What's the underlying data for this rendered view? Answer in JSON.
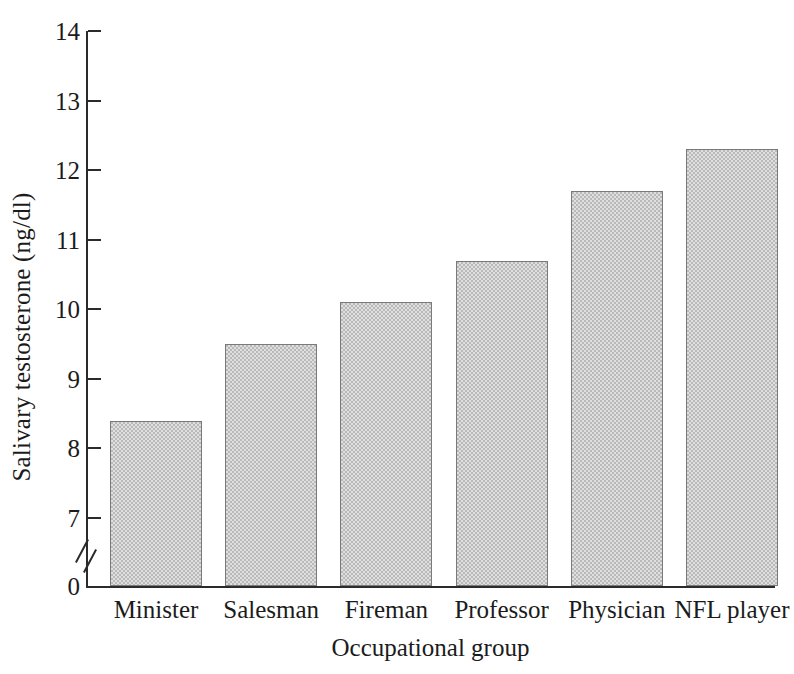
{
  "chart_data": {
    "type": "bar",
    "title": "",
    "subtitle": "",
    "xlabel": "Occupational group",
    "ylabel": "Salivary testosterone (ng/dl)",
    "categories": [
      "Minister",
      "Salesman",
      "Fireman",
      "Professor",
      "Physician",
      "NFL player"
    ],
    "values": [
      8.4,
      9.5,
      10.1,
      10.7,
      11.7,
      12.3
    ],
    "series": [
      {
        "name": "Salivary testosterone",
        "values": [
          8.4,
          9.5,
          10.1,
          10.7,
          11.7,
          12.3
        ]
      }
    ],
    "ylim": [
      7,
      14
    ],
    "ytick_labels": [
      "0",
      "7",
      "8",
      "9",
      "10",
      "11",
      "12",
      "13",
      "14"
    ],
    "yticks": [
      0,
      7,
      8,
      9,
      10,
      11,
      12,
      13,
      14
    ],
    "y_axis_break": true,
    "y_axis_break_note": "axis broken between 0 and 7",
    "grid": false,
    "legend": false,
    "legend_position": "none",
    "bar_fill_color": "#b9b9b9",
    "bar_border_color": "#7a7a7a",
    "axis_color": "#2b2b2b",
    "background_color": "#ffffff"
  }
}
